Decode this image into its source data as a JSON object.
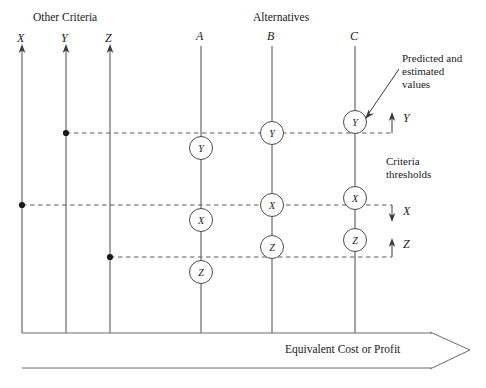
{
  "figure": {
    "headers": {
      "other_criteria": "Other Criteria",
      "alternatives": "Alternatives"
    },
    "criteria_axes": [
      {
        "label": "X",
        "x": 22
      },
      {
        "label": "Y",
        "x": 66
      },
      {
        "label": "Z",
        "x": 110
      }
    ],
    "alternative_axes": [
      {
        "label": "A",
        "x": 201
      },
      {
        "label": "B",
        "x": 272
      },
      {
        "label": "C",
        "x": 355
      }
    ],
    "nodes": [
      {
        "axis": "A",
        "label": "Y",
        "x": 201,
        "y": 148
      },
      {
        "axis": "A",
        "label": "X",
        "x": 201,
        "y": 220
      },
      {
        "axis": "A",
        "label": "Z",
        "x": 201,
        "y": 272
      },
      {
        "axis": "B",
        "label": "Y",
        "x": 272,
        "y": 133
      },
      {
        "axis": "B",
        "label": "X",
        "x": 272,
        "y": 205
      },
      {
        "axis": "B",
        "label": "Z",
        "x": 272,
        "y": 247
      },
      {
        "axis": "C",
        "label": "Y",
        "x": 355,
        "y": 122
      },
      {
        "axis": "C",
        "label": "X",
        "x": 355,
        "y": 198
      },
      {
        "axis": "C",
        "label": "Z",
        "x": 355,
        "y": 240
      }
    ],
    "thresholds": [
      {
        "label": "Y",
        "y": 133,
        "origin_x": 66,
        "direction": "up"
      },
      {
        "label": "X",
        "y": 205,
        "origin_x": 22,
        "direction": "down"
      },
      {
        "label": "Z",
        "y": 257,
        "origin_x": 110,
        "direction": "up"
      }
    ],
    "annotations": {
      "predicted": [
        "Predicted and",
        "estimated",
        "values"
      ],
      "criteria_thresholds": [
        "Criteria",
        "thresholds"
      ]
    },
    "baseline_label": "Equivalent Cost or Profit",
    "colors": {
      "stroke": "#4a4a4a",
      "text": "#1a1a1a",
      "background": "#ffffff"
    }
  }
}
